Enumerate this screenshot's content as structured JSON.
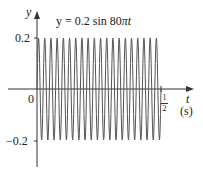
{
  "chart_data": {
    "type": "line",
    "title": "y = 0.2 sin 80πt",
    "xlabel": "t",
    "xunit": "(s)",
    "ylabel": "y",
    "function": "y = 0.2*sin(80*pi*t)",
    "amplitude": 0.2,
    "angular_frequency": "80π",
    "cycles_shown": 20,
    "xlim": [
      0,
      0.5
    ],
    "ylim": [
      -0.2,
      0.2
    ],
    "x_ticks": [
      {
        "value": 0,
        "label": "0"
      },
      {
        "value": 0.5,
        "label": "1/2"
      }
    ],
    "y_ticks": [
      {
        "value": 0.2,
        "label": "0.2"
      },
      {
        "value": -0.2,
        "label": "−0.2"
      }
    ],
    "grid": false,
    "legend": null
  },
  "labels": {
    "title_prefix": "y = 0.2 sin 80",
    "title_pi": "π",
    "title_t": "t",
    "y_axis": "y",
    "x_axis": "t",
    "x_unit": "(s)",
    "origin": "0",
    "y_top": "0.2",
    "y_bottom": "−0.2",
    "x_end_num": "1",
    "x_end_den": "2"
  },
  "colors": {
    "axis": "#333333",
    "curve": "#555555"
  }
}
